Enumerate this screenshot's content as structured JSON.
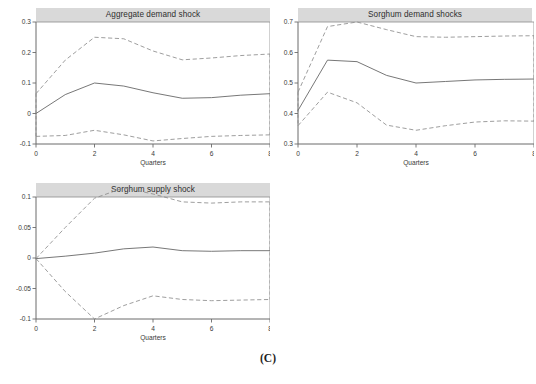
{
  "figure": {
    "caption": "(C)",
    "background_color": "#ffffff",
    "title_bar_color": "#d9d9d9",
    "irf_line_color": "#5f5f5f",
    "band_line_color": "#8d8d8d",
    "axis_color": "#6b6b6b"
  },
  "chart_data": [
    {
      "type": "line",
      "title": "Aggregate demand shock",
      "xlabel": "Quarters",
      "ylabel": "",
      "xlim": [
        0,
        8
      ],
      "ylim": [
        -0.1,
        0.3
      ],
      "xticks": [
        0,
        2,
        4,
        6,
        8
      ],
      "xtick_labels": [
        "0",
        "2",
        "4",
        "6",
        "8"
      ],
      "yticks": [
        -0.1,
        0,
        0.1,
        0.2,
        0.3
      ],
      "ytick_labels": [
        "-0.1",
        "0",
        "0.1",
        "0.2",
        "0.3"
      ],
      "grid": false,
      "legend": "none",
      "x": [
        0,
        1,
        2,
        3,
        4,
        5,
        6,
        7,
        8
      ],
      "series": [
        {
          "name": "Impulse response",
          "style": "solid",
          "values": [
            0.0,
            0.062,
            0.1,
            0.09,
            0.068,
            0.05,
            0.052,
            0.06,
            0.065
          ]
        },
        {
          "name": "Upper 95% confidence band",
          "style": "dashed",
          "values": [
            0.065,
            0.175,
            0.25,
            0.245,
            0.205,
            0.176,
            0.182,
            0.19,
            0.195
          ]
        },
        {
          "name": "Lower 95% confidence band",
          "style": "dashed",
          "values": [
            -0.075,
            -0.072,
            -0.055,
            -0.07,
            -0.09,
            -0.082,
            -0.075,
            -0.072,
            -0.07
          ]
        }
      ],
      "annotations": [
        "dashed bands close vertically at quarter 0 and quarter 8"
      ]
    },
    {
      "type": "line",
      "title": "Sorghum demand shocks",
      "xlabel": "Quarters",
      "ylabel": "",
      "xlim": [
        0,
        8
      ],
      "ylim": [
        0.3,
        0.7
      ],
      "xticks": [
        0,
        2,
        4,
        6,
        8
      ],
      "xtick_labels": [
        "0",
        "2",
        "4",
        "6",
        "8"
      ],
      "yticks": [
        0.3,
        0.4,
        0.5,
        0.6,
        0.7
      ],
      "ytick_labels": [
        "0.3",
        "0.4",
        "0.5",
        "0.6",
        "0.7"
      ],
      "grid": false,
      "legend": "none",
      "x": [
        0,
        1,
        2,
        3,
        4,
        5,
        6,
        7,
        8
      ],
      "series": [
        {
          "name": "Impulse response",
          "style": "solid",
          "values": [
            0.41,
            0.575,
            0.57,
            0.525,
            0.5,
            0.505,
            0.51,
            0.512,
            0.513
          ]
        },
        {
          "name": "Upper 95% confidence band",
          "style": "dashed",
          "values": [
            0.47,
            0.685,
            0.7,
            0.675,
            0.652,
            0.65,
            0.652,
            0.654,
            0.655
          ]
        },
        {
          "name": "Lower 95% confidence band",
          "style": "dashed",
          "values": [
            0.36,
            0.47,
            0.435,
            0.362,
            0.345,
            0.36,
            0.372,
            0.376,
            0.375
          ]
        }
      ],
      "annotations": [
        "dashed bands close vertically at quarter 0 and quarter 8"
      ]
    },
    {
      "type": "line",
      "title": "Sorghum supply shock",
      "xlabel": "Quarters",
      "ylabel": "",
      "xlim": [
        0,
        8
      ],
      "ylim": [
        -0.1,
        0.1
      ],
      "xticks": [
        0,
        2,
        4,
        6,
        8
      ],
      "xtick_labels": [
        "0",
        "2",
        "4",
        "6",
        "8"
      ],
      "yticks": [
        -0.1,
        -0.05,
        0,
        0.05,
        0.1
      ],
      "ytick_labels": [
        "-0.1",
        "-0.05",
        "0",
        "0.05",
        "0.1"
      ],
      "grid": false,
      "legend": "none",
      "x": [
        0,
        1,
        2,
        3,
        4,
        5,
        6,
        7,
        8
      ],
      "series": [
        {
          "name": "Impulse response",
          "style": "solid",
          "values": [
            -0.001,
            0.003,
            0.008,
            0.015,
            0.018,
            0.012,
            0.011,
            0.012,
            0.012
          ]
        },
        {
          "name": "Upper 95% confidence band",
          "style": "dashed",
          "values": [
            -0.001,
            0.05,
            0.098,
            0.115,
            0.105,
            0.092,
            0.09,
            0.092,
            0.092
          ]
        },
        {
          "name": "Lower 95% confidence band",
          "style": "dashed",
          "values": [
            -0.001,
            -0.055,
            -0.1,
            -0.078,
            -0.062,
            -0.068,
            -0.07,
            -0.069,
            -0.068
          ]
        }
      ],
      "annotations": [
        "dashed bands close vertically at quarter 8"
      ]
    }
  ]
}
